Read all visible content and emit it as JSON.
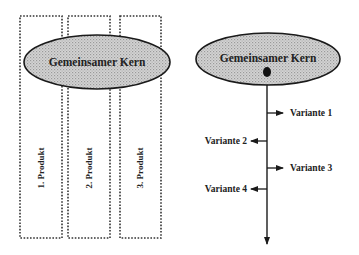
{
  "left_diagram": {
    "core_label": "Gemeinsamer Kern",
    "products": [
      {
        "label": "1. Produkt"
      },
      {
        "label": "2. Produkt"
      },
      {
        "label": "3. Produkt"
      }
    ]
  },
  "right_diagram": {
    "core_label": "Gemeinsamer Kern",
    "variants": [
      {
        "label": "Variante 1",
        "side": "right"
      },
      {
        "label": "Variante 2",
        "side": "left"
      },
      {
        "label": "Variante 3",
        "side": "right"
      },
      {
        "label": "Variante 4",
        "side": "left"
      }
    ]
  },
  "colors": {
    "ellipse_fill": "#c8c8c8",
    "stroke": "#1a1a1a",
    "dotted_border": "#333333"
  }
}
